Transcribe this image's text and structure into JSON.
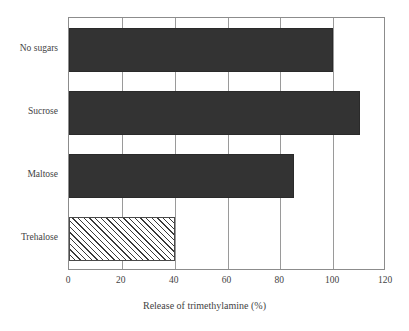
{
  "chart_data": {
    "type": "bar",
    "orientation": "horizontal",
    "title": "",
    "subtitle": "",
    "xlabel": "Release of trimethylamine (%)",
    "ylabel": "",
    "categories": [
      "No sugars",
      "Sucrose",
      "Maltose",
      "Trehalose"
    ],
    "values": [
      100,
      110,
      85,
      40
    ],
    "series": [
      {
        "name": "Release of trimethylamine (%)",
        "values": [
          100,
          110,
          85,
          40
        ]
      }
    ],
    "xlim": [
      0,
      120
    ],
    "xticks": [
      0,
      20,
      40,
      60,
      80,
      100,
      120
    ],
    "xtick_labels": [
      "0",
      "20",
      "40",
      "60",
      "80",
      "100",
      "120"
    ],
    "grid": true,
    "grid_axis": "x",
    "legend": false,
    "legend_position": "none",
    "annotations": [],
    "bar_styles": [
      {
        "category": "No sugars",
        "fill": "solid",
        "color": "#333333"
      },
      {
        "category": "Sucrose",
        "fill": "solid",
        "color": "#333333"
      },
      {
        "category": "Maltose",
        "fill": "solid",
        "color": "#333333"
      },
      {
        "category": "Trehalose",
        "fill": "diagonal-hatch",
        "color": "#ffffff",
        "hatch_color": "#3a3a3a"
      }
    ]
  },
  "style": {
    "background": "#ffffff",
    "axis_color": "#8c8c8c",
    "grid_color": "#9a9a9a",
    "text_color": "#434343",
    "bar_color": "#333333"
  }
}
